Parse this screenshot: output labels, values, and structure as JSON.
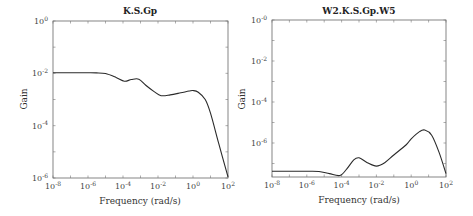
{
  "chart_data": [
    {
      "type": "line",
      "title": "K.S.Gp",
      "xlabel": "Frequency (rad/s)",
      "ylabel": "Gain",
      "xscale": "log",
      "yscale": "log",
      "xlim": [
        1e-08,
        100
      ],
      "ylim": [
        1e-06,
        1
      ],
      "x_ticks": [
        "10^-8",
        "10^-6",
        "10^-4",
        "10^-2",
        "10^0",
        "10^2"
      ],
      "y_ticks": [
        "10^0",
        "10^-2",
        "10^-4",
        "10^-6"
      ],
      "grid": false,
      "legend": null,
      "series": [
        {
          "name": "K.S.Gp",
          "x": [
            1e-08,
            1e-07,
            1e-06,
            3e-06,
            1e-05,
            4e-05,
            0.00012,
            0.0003,
            0.0008,
            0.002,
            0.006,
            0.015,
            0.05,
            0.2,
            0.6,
            1.0,
            2.0,
            5.0,
            10,
            30,
            100
          ],
          "y": [
            0.0105,
            0.0105,
            0.0105,
            0.0104,
            0.0098,
            0.007,
            0.005,
            0.0058,
            0.006,
            0.0035,
            0.002,
            0.0014,
            0.0015,
            0.0018,
            0.0021,
            0.0022,
            0.0019,
            0.001,
            0.0003,
            2e-05,
            1.1e-06
          ]
        }
      ]
    },
    {
      "type": "line",
      "title": "W2.K.S.Gp.W5",
      "xlabel": "Frequency (rad/s)",
      "ylabel": "Gain",
      "xscale": "log",
      "yscale": "log",
      "xlim": [
        1e-08,
        100
      ],
      "ylim": [
        2.2e-08,
        1
      ],
      "x_ticks": [
        "10^-8",
        "10^-6",
        "10^-4",
        "10^-2",
        "10^0",
        "10^2"
      ],
      "y_ticks": [
        "10^-0",
        "10^-2",
        "10^-4",
        "10^-6"
      ],
      "grid": false,
      "legend": null,
      "series": [
        {
          "name": "W2.K.S.Gp.W5",
          "x": [
            1e-08,
            1e-07,
            1e-06,
            5e-06,
            2e-05,
            8e-05,
            0.0002,
            0.0005,
            0.001,
            0.003,
            0.01,
            0.03,
            0.1,
            0.5,
            1.0,
            3.0,
            6.0,
            15,
            40,
            100
          ],
          "y": [
            4.2e-08,
            4.2e-08,
            4.2e-08,
            4.1e-08,
            3.2e-08,
            2.6e-08,
            5.5e-08,
            1.5e-07,
            1.9e-07,
            1.1e-07,
            7.5e-08,
            1.1e-07,
            2.6e-07,
            8e-07,
            1.6e-06,
            3.6e-06,
            4.3e-06,
            2.4e-06,
            3.5e-07,
            3.2e-08
          ]
        }
      ]
    }
  ],
  "plots": {
    "left": {
      "title": "K.S.Gp",
      "ylabel": "Gain",
      "xlabel": "Frequency (rad/s)",
      "xticks": [
        {
          "base": "10",
          "exp": "-8"
        },
        {
          "base": "10",
          "exp": "-6"
        },
        {
          "base": "10",
          "exp": "-4"
        },
        {
          "base": "10",
          "exp": "-2"
        },
        {
          "base": "10",
          "exp": "0"
        },
        {
          "base": "10",
          "exp": "2"
        }
      ],
      "yticks": [
        {
          "base": "10",
          "exp": "0"
        },
        {
          "base": "10",
          "exp": "-2"
        },
        {
          "base": "10",
          "exp": "-4"
        },
        {
          "base": "10",
          "exp": "-6"
        }
      ]
    },
    "right": {
      "title": "W2.K.S.Gp.W5",
      "ylabel": "Gain",
      "xlabel": "Frequency (rad/s)",
      "xticks": [
        {
          "base": "10",
          "exp": "-8"
        },
        {
          "base": "10",
          "exp": "-6"
        },
        {
          "base": "10",
          "exp": "-4"
        },
        {
          "base": "10",
          "exp": "-2"
        },
        {
          "base": "10",
          "exp": "0"
        },
        {
          "base": "10",
          "exp": "2"
        }
      ],
      "yticks": [
        {
          "base": "10",
          "exp": "-0"
        },
        {
          "base": "10",
          "exp": "-2"
        },
        {
          "base": "10",
          "exp": "-4"
        },
        {
          "base": "10",
          "exp": "-6"
        }
      ]
    }
  },
  "colors": {
    "line": "#2a2a2a",
    "axes": "#555555",
    "text": "#333333",
    "background": "#ffffff"
  }
}
